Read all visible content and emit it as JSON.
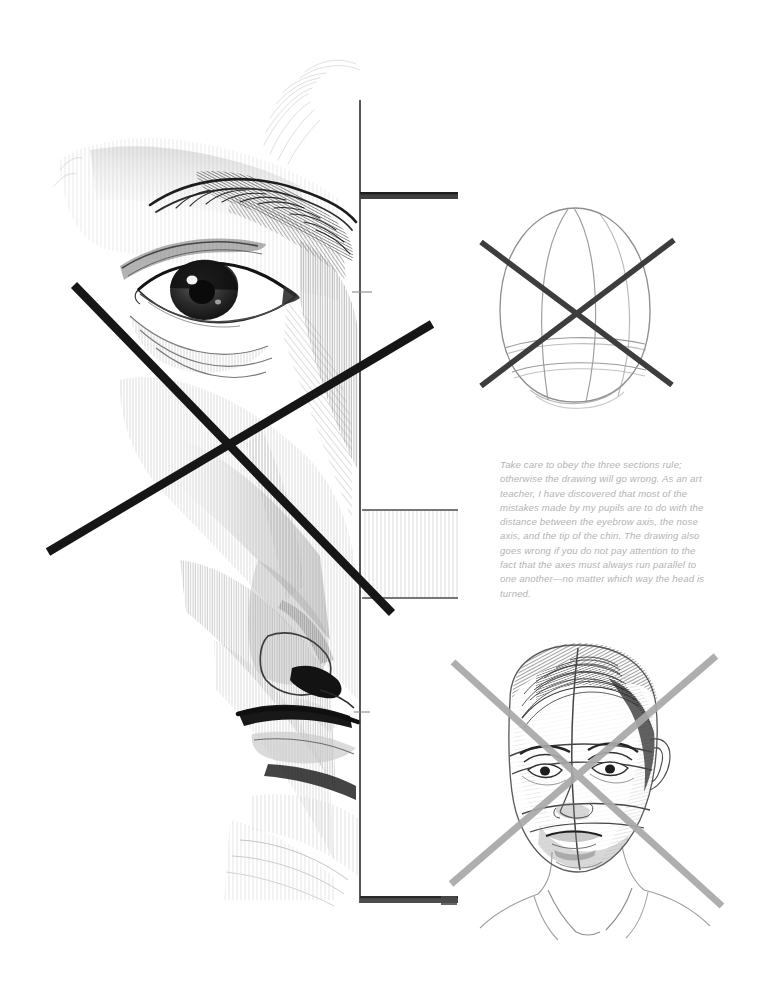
{
  "page": {
    "kind": "art-instruction-book-page",
    "background_color": "#ffffff",
    "width": 762,
    "height": 986,
    "medium": "graphite pencil drawing"
  },
  "caption": {
    "text": "Take care to obey the three sections rule; otherwise the drawing will go wrong. As an art teacher, I have discovered that most of the mistakes made by my pupils are to do with the distance between the eyebrow axis, the nose axis, and the tip of the chin. The drawing also goes wrong if you do not pay attention to the fact that the axes must always run parallel to one another—no matter which way the head is turned.",
    "color": "#b3b3b3",
    "style": "italic"
  },
  "figures": [
    {
      "id": "main-half-face",
      "name": "half-face-pencil-study",
      "description": "Large shaded pencil rendering of the left half of a man's face — brow, eye, cheek, nose and mouth — bisected by a vertical center axis with horizontal tick marks at the eyebrow axis, nose axis and chin.",
      "crossed_out": true,
      "cross_color": "#1a1a1a"
    },
    {
      "id": "egg-construction",
      "name": "egg-head-construction-diagram",
      "description": "Faint ovoid (egg) head construction with vertical meridian and horizontal eyebrow and nose latitude lines.",
      "crossed_out": true,
      "cross_color": "#3b3b3b"
    },
    {
      "id": "finished-head",
      "name": "finished-head-pencil-study",
      "description": "Three-quarter shaded pencil portrait of a man with slicked hair, collared shirt, overlaid with curved construction axes.",
      "crossed_out": true,
      "cross_color": "#9a9a9a"
    }
  ],
  "axes": {
    "vertical_axis_label": "center axis",
    "ticks": [
      {
        "name": "eyebrow-axis-tick"
      },
      {
        "name": "nose-axis-tick"
      },
      {
        "name": "chin-axis-tick"
      }
    ]
  },
  "colors": {
    "paper": "#ffffff",
    "graphite_dark": "#2b2b2b",
    "graphite_mid": "#6e6e6e",
    "graphite_light": "#c8c8c8",
    "caption_gray": "#b3b3b3"
  }
}
